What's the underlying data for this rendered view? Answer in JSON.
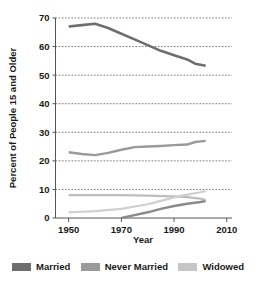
{
  "chart_data": {
    "type": "line",
    "title": "",
    "xlabel": "Year",
    "ylabel": "Percent of People 15 and Older",
    "xlim": [
      1945,
      2012
    ],
    "ylim": [
      0,
      70
    ],
    "xticks": [
      1950,
      1970,
      1990,
      2010
    ],
    "yticks": [
      0,
      10,
      20,
      30,
      40,
      50,
      60,
      70
    ],
    "grid": "horizontal-dotted",
    "legend_position": "bottom",
    "series": [
      {
        "name": "Married",
        "color": "#6e6e6e",
        "x": [
          1950,
          1955,
          1960,
          1965,
          1970,
          1975,
          1980,
          1985,
          1990,
          1995,
          1998,
          2002
        ],
        "values": [
          67,
          67.5,
          68,
          66.5,
          64.5,
          62.5,
          60.5,
          58.5,
          57,
          55.5,
          54,
          53.3
        ]
      },
      {
        "name": "Never Married",
        "color": "#9a9a9a",
        "x": [
          1950,
          1955,
          1960,
          1965,
          1970,
          1975,
          1980,
          1985,
          1990,
          1995,
          1998,
          2002
        ],
        "values": [
          23,
          22.4,
          22,
          22.8,
          23.9,
          24.8,
          25,
          25.2,
          25.5,
          25.7,
          26.6,
          27
        ]
      },
      {
        "name": "Widowed",
        "color": "#bdbdbd",
        "x": [
          1950,
          1960,
          1970,
          1980,
          1990,
          1995,
          2000,
          2002
        ],
        "values": [
          8,
          8,
          8,
          7.8,
          7.6,
          7.3,
          6.8,
          6.3
        ]
      },
      {
        "name": "Widowed-lower",
        "color": "#cfcfcf",
        "x": [
          1950,
          1960,
          1970,
          1980,
          1985,
          1990,
          1995,
          2000,
          2002
        ],
        "values": [
          2,
          2.4,
          3.2,
          4.8,
          6.0,
          7.2,
          8.2,
          9.0,
          9.4
        ]
      },
      {
        "name": "Divorced",
        "color": "#8a8a8a",
        "x": [
          1970,
          1975,
          1980,
          1985,
          1990,
          1995,
          2000,
          2002
        ],
        "values": [
          0,
          1.0,
          2.0,
          3.2,
          4.2,
          5.0,
          5.6,
          5.9
        ]
      }
    ]
  },
  "legend": {
    "items": [
      {
        "label": "Married",
        "color": "#6e6e6e"
      },
      {
        "label": "Never Married",
        "color": "#9a9a9a"
      },
      {
        "label": "Widowed",
        "color": "#c6c6c6"
      }
    ]
  },
  "axes": {
    "y_title": "Percent of People 15 and Older",
    "x_title": "Year",
    "y_tick_labels": [
      "0",
      "10",
      "20",
      "30",
      "40",
      "50",
      "60",
      "70"
    ],
    "x_tick_labels": [
      "1950",
      "1970",
      "1990",
      "2010"
    ]
  }
}
